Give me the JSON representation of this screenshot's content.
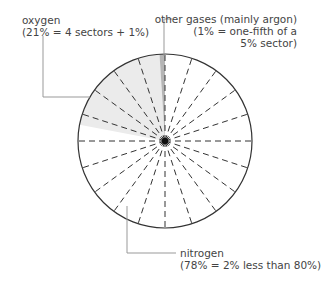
{
  "chart_data": {
    "type": "pie",
    "title": "",
    "grid": "20 dashed sectors of 5% each",
    "sector_size_percent": 5,
    "sector_count": 20,
    "categories": [
      "nitrogen",
      "oxygen",
      "other gases (mainly argon)"
    ],
    "values": [
      78,
      21,
      1
    ],
    "colors": {
      "nitrogen": "#ffffff",
      "oxygen": "#ebebeb",
      "other gases (mainly argon)": "#b5b5b5"
    },
    "annotations": [
      {
        "target": "oxygen",
        "line1": "oxygen",
        "line2": "(21% = 4 sectors + 1%)"
      },
      {
        "target": "other gases (mainly argon)",
        "line1": "other gases (mainly argon)",
        "line2": "(1% = one-fifth of a",
        "line3": "5% sector)"
      },
      {
        "target": "nitrogen",
        "line1": "nitrogen",
        "line2": "(78% = 2% less than 80%)"
      }
    ]
  },
  "labels": {
    "oxygen": {
      "line1": "oxygen",
      "line2": "(21% = 4 sectors + 1%)"
    },
    "argon": {
      "line1": "other gases (mainly argon)",
      "line2": "(1% = one-fifth of a",
      "line3": "5% sector)"
    },
    "nitrogen": {
      "line1": "nitrogen",
      "line2": "(78% = 2% less than 80%)"
    }
  }
}
